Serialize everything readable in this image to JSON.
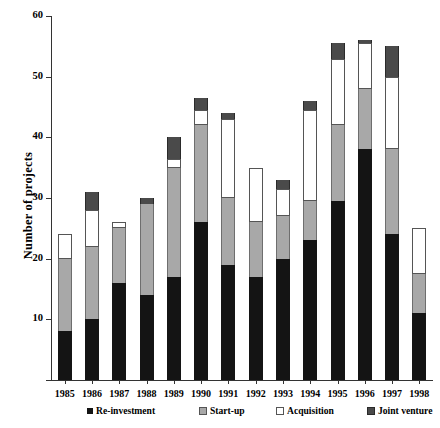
{
  "chart_data": {
    "type": "bar",
    "subtype": "stacked-bar",
    "title": "",
    "xlabel": "",
    "ylabel": "Number of projects",
    "ylim": [
      0,
      60
    ],
    "ytick_step": 10,
    "yticks": [
      0,
      10,
      20,
      30,
      40,
      50,
      60
    ],
    "ytick_labels": [
      "",
      "10",
      "20",
      "30",
      "40",
      "50",
      "60"
    ],
    "grid": false,
    "legend_position": "bottom",
    "categories": [
      "1985",
      "1986",
      "1987",
      "1988",
      "1989",
      "1990",
      "1991",
      "1992",
      "1993",
      "1994",
      "1995",
      "1996",
      "1997",
      "1998"
    ],
    "series": [
      {
        "name": "Re-investment",
        "color": "#141414",
        "values": [
          8,
          10,
          16,
          14,
          17,
          26,
          19,
          17,
          20,
          23,
          29.5,
          38,
          24,
          11
        ]
      },
      {
        "name": "Start-up",
        "color": "#a8a8a8",
        "values": [
          12,
          12,
          9,
          15,
          18,
          16,
          11,
          9,
          7,
          6.5,
          12.5,
          10,
          14,
          6.5
        ]
      },
      {
        "name": "Acquisition",
        "color": "#ffffff",
        "values": [
          4,
          6,
          1,
          0,
          1.5,
          2.5,
          13,
          9,
          4.5,
          15,
          11,
          7.5,
          12,
          7.5
        ]
      },
      {
        "name": "Joint venture",
        "color": "#4a4a4a",
        "values": [
          0,
          3,
          0,
          1,
          3.5,
          2,
          1,
          0,
          1.5,
          1.5,
          2.5,
          0.5,
          5,
          0
        ]
      }
    ],
    "totals": [
      24,
      31,
      26,
      30,
      40,
      46.5,
      44,
      35,
      33,
      46,
      55.5,
      56,
      55,
      25
    ]
  },
  "legend": {
    "items": [
      {
        "label": "Re-investment",
        "swatch_class": "sw-reinvestment"
      },
      {
        "label": "Start-up",
        "swatch_class": "sw-startup"
      },
      {
        "label": "Acquisition",
        "swatch_class": "sw-acquisition"
      },
      {
        "label": "Joint venture",
        "swatch_class": "sw-jointventure"
      }
    ]
  }
}
